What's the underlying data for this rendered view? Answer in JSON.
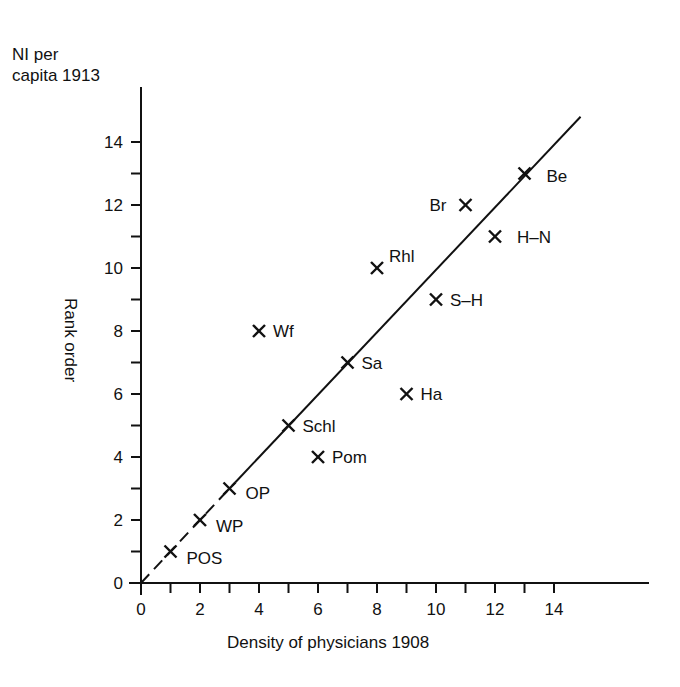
{
  "chart_data": {
    "type": "scatter",
    "title": "",
    "ylabel_top": [
      "NI per",
      "capita 1913"
    ],
    "ylabel": "Rank order",
    "xlabel": "Density of physicians 1908",
    "xlim": [
      0,
      16
    ],
    "ylim": [
      0,
      15
    ],
    "x_ticks": [
      0,
      2,
      4,
      6,
      8,
      10,
      12,
      14
    ],
    "y_ticks": [
      0,
      2,
      4,
      6,
      8,
      10,
      12,
      14
    ],
    "grid": false,
    "marker": "x",
    "points": [
      {
        "label": "POS",
        "x": 1,
        "y": 1
      },
      {
        "label": "WP",
        "x": 2,
        "y": 2
      },
      {
        "label": "OP",
        "x": 3,
        "y": 3
      },
      {
        "label": "Pom",
        "x": 6,
        "y": 4
      },
      {
        "label": "Schl",
        "x": 5,
        "y": 5
      },
      {
        "label": "Ha",
        "x": 9,
        "y": 6
      },
      {
        "label": "Sa",
        "x": 7,
        "y": 7
      },
      {
        "label": "Wf",
        "x": 4,
        "y": 8
      },
      {
        "label": "S-H",
        "x": 10,
        "y": 9
      },
      {
        "label": "Rhl",
        "x": 8,
        "y": 10
      },
      {
        "label": "H-N",
        "x": 12,
        "y": 11
      },
      {
        "label": "Br",
        "x": 11,
        "y": 12
      },
      {
        "label": "Be",
        "x": 13,
        "y": 13
      }
    ],
    "reference_line": {
      "from": [
        0,
        0
      ],
      "to": [
        14.9,
        14.8
      ],
      "style": "dashed below OP, solid above"
    }
  },
  "labels": {
    "ylabel_line1": "NI per",
    "ylabel_line2": "capita 1913",
    "ylabel_rot": "Rank order",
    "xlabel": "Density of physicians 1908"
  }
}
